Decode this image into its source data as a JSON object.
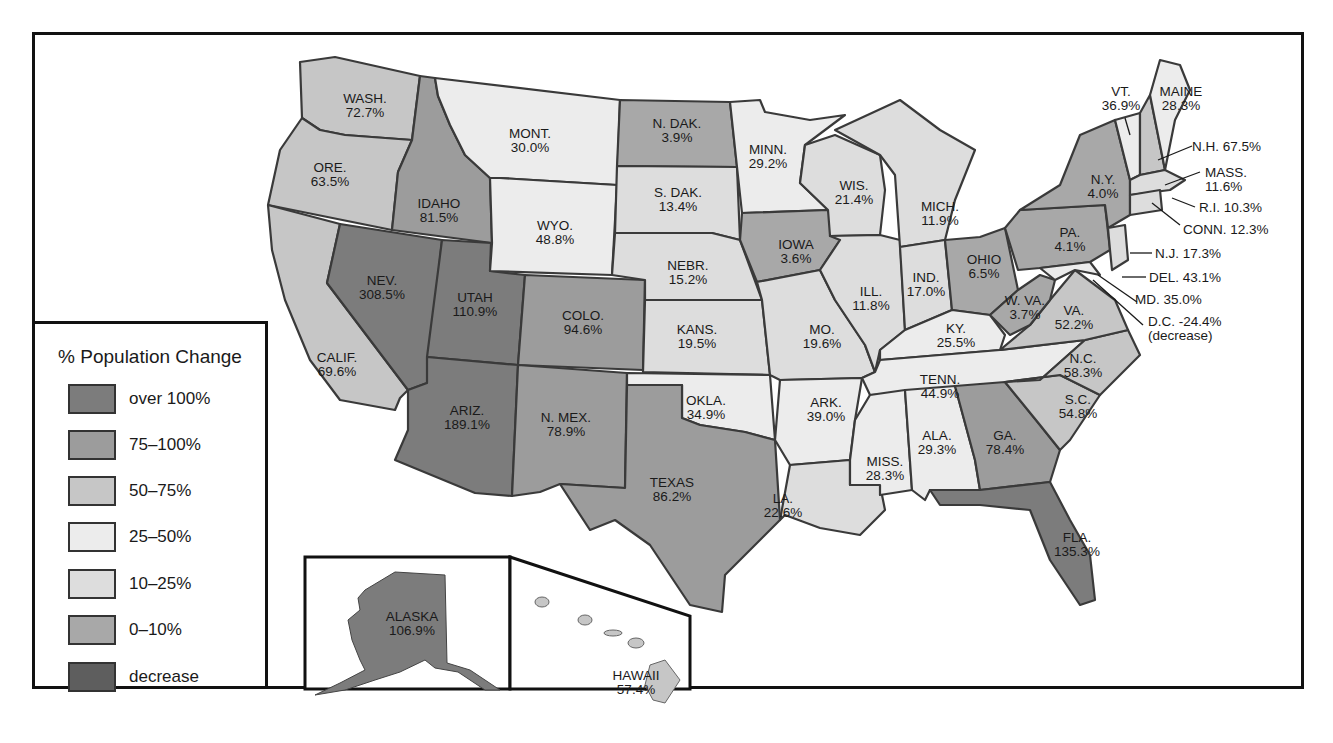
{
  "legend": {
    "title": "% Population Change",
    "items": [
      {
        "label": "over 100%",
        "color": "#7c7c7c"
      },
      {
        "label": "75–100%",
        "color": "#9c9c9c"
      },
      {
        "label": "50–75%",
        "color": "#c6c6c6"
      },
      {
        "label": "25–50%",
        "color": "#ececec"
      },
      {
        "label": "10–25%",
        "color": "#dddddd"
      },
      {
        "label": "0–10%",
        "color": "#a8a8a8"
      },
      {
        "label": "decrease",
        "color": "#5e5e5e"
      }
    ]
  },
  "states": {
    "wash": {
      "name": "WASH.",
      "value": "72.7%"
    },
    "ore": {
      "name": "ORE.",
      "value": "63.5%"
    },
    "calif": {
      "name": "CALIF.",
      "value": "69.6%"
    },
    "idaho": {
      "name": "IDAHO",
      "value": "81.5%"
    },
    "nev": {
      "name": "NEV.",
      "value": "308.5%"
    },
    "utah": {
      "name": "UTAH",
      "value": "110.9%"
    },
    "ariz": {
      "name": "ARIZ.",
      "value": "189.1%"
    },
    "mont": {
      "name": "MONT.",
      "value": "30.0%"
    },
    "wyo": {
      "name": "WYO.",
      "value": "48.8%"
    },
    "colo": {
      "name": "COLO.",
      "value": "94.6%"
    },
    "nmex": {
      "name": "N. MEX.",
      "value": "78.9%"
    },
    "ndak": {
      "name": "N. DAK.",
      "value": "3.9%"
    },
    "sdak": {
      "name": "S. DAK.",
      "value": "13.4%"
    },
    "nebr": {
      "name": "NEBR.",
      "value": "15.2%"
    },
    "kans": {
      "name": "KANS.",
      "value": "19.5%"
    },
    "okla": {
      "name": "OKLA.",
      "value": "34.9%"
    },
    "texas": {
      "name": "TEXAS",
      "value": "86.2%"
    },
    "minn": {
      "name": "MINN.",
      "value": "29.2%"
    },
    "iowa": {
      "name": "IOWA",
      "value": "3.6%"
    },
    "mo": {
      "name": "MO.",
      "value": "19.6%"
    },
    "ark": {
      "name": "ARK.",
      "value": "39.0%"
    },
    "la": {
      "name": "LA.",
      "value": "22.6%"
    },
    "wis": {
      "name": "WIS.",
      "value": "21.4%"
    },
    "ill": {
      "name": "ILL.",
      "value": "11.8%"
    },
    "mich": {
      "name": "MICH.",
      "value": "11.9%"
    },
    "ind": {
      "name": "IND.",
      "value": "17.0%"
    },
    "ohio": {
      "name": "OHIO",
      "value": "6.5%"
    },
    "ky": {
      "name": "KY.",
      "value": "25.5%"
    },
    "tenn": {
      "name": "TENN.",
      "value": "44.9%"
    },
    "miss": {
      "name": "MISS.",
      "value": "28.3%"
    },
    "ala": {
      "name": "ALA.",
      "value": "29.3%"
    },
    "ga": {
      "name": "GA.",
      "value": "78.4%"
    },
    "fla": {
      "name": "FLA.",
      "value": "135.3%"
    },
    "sc": {
      "name": "S.C.",
      "value": "54.8%"
    },
    "nc": {
      "name": "N.C.",
      "value": "58.3%"
    },
    "va": {
      "name": "VA.",
      "value": "52.2%"
    },
    "wva": {
      "name": "W. VA.",
      "value": "3.7%"
    },
    "pa": {
      "name": "PA.",
      "value": "4.1%"
    },
    "ny": {
      "name": "N.Y.",
      "value": "4.0%"
    },
    "vt": {
      "name": "VT.",
      "value": "36.9%"
    },
    "maine": {
      "name": "MAINE",
      "value": "28.3%"
    },
    "nh": {
      "label": "N.H. 67.5%"
    },
    "mass": {
      "name": "MASS.",
      "value": "11.6%"
    },
    "ri": {
      "label": "R.I. 10.3%"
    },
    "conn": {
      "label": "CONN. 12.3%"
    },
    "nj": {
      "label": "N.J. 17.3%"
    },
    "del": {
      "label": "DEL. 43.1%"
    },
    "md": {
      "label": "MD. 35.0%"
    },
    "dc": {
      "label": "D.C. -24.4%",
      "note": "(decrease)"
    },
    "alaska": {
      "name": "ALASKA",
      "value": "106.9%"
    },
    "hawaii": {
      "name": "HAWAII",
      "value": "57.4%"
    }
  }
}
